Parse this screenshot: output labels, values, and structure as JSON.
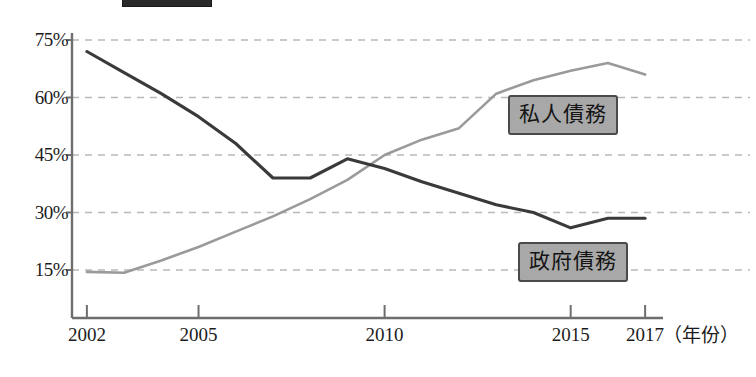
{
  "chart_data": {
    "type": "line",
    "title": "",
    "xlabel": "（年份）",
    "ylabel": "",
    "xlim": [
      2001.6,
      2017.4
    ],
    "ylim": [
      8,
      79
    ],
    "grid": true,
    "grid_axis": "y",
    "legend_position": "inline-callout",
    "x_tick_labels": [
      "2002",
      "2005",
      "2010",
      "2015",
      "2017"
    ],
    "x_tick_values": [
      2002,
      2005,
      2010,
      2015,
      2017
    ],
    "y_tick_labels": [
      "15%",
      "30%",
      "45%",
      "60%",
      "75%"
    ],
    "y_tick_values": [
      15,
      30,
      45,
      60,
      75
    ],
    "series": [
      {
        "name": "政府債務",
        "color": "#3a3a3a",
        "x": [
          2002,
          2003,
          2004,
          2005,
          2006,
          2007,
          2008,
          2009,
          2010,
          2011,
          2012,
          2013,
          2014,
          2015,
          2016,
          2017
        ],
        "values": [
          72,
          66.5,
          61,
          55,
          48,
          39,
          39,
          44,
          41.5,
          38,
          35,
          32,
          30,
          26,
          28.5,
          28.5
        ]
      },
      {
        "name": "私人債務",
        "color": "#9a9a9a",
        "x": [
          2002,
          2003,
          2004,
          2005,
          2006,
          2007,
          2008,
          2009,
          2010,
          2011,
          2012,
          2013,
          2014,
          2015,
          2016,
          2017
        ],
        "values": [
          14.5,
          14.3,
          17.5,
          21,
          25,
          29,
          33.5,
          38.5,
          45,
          49,
          52,
          61,
          64.5,
          67,
          69,
          66
        ]
      }
    ]
  },
  "axis": {
    "x_title": "（年份）"
  },
  "labels": {
    "private_debt": "私人債務",
    "government_debt": "政府債務"
  }
}
